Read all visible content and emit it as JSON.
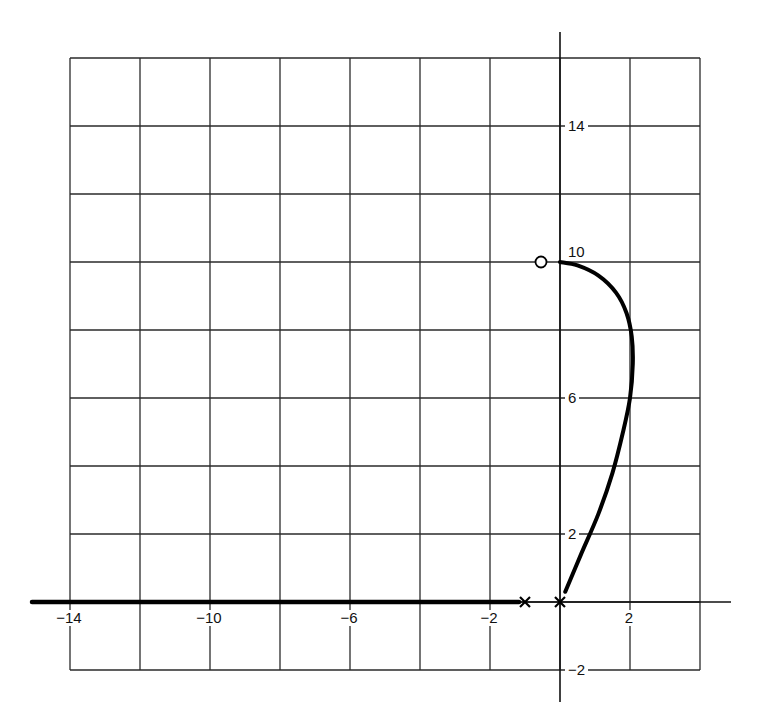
{
  "chart_data": {
    "type": "line",
    "title": "",
    "subtitle": "",
    "xlabel": "",
    "ylabel": "",
    "xlim": [
      -15,
      5
    ],
    "ylim": [
      -3,
      17
    ],
    "grid": true,
    "grid_spacing": 2,
    "grid_extent": {
      "x": [
        -14,
        4
      ],
      "y": [
        -2,
        16
      ]
    },
    "legend": null,
    "x_tick_labels": [
      {
        "value": -14,
        "label": "−14"
      },
      {
        "value": -10,
        "label": "−10"
      },
      {
        "value": -6,
        "label": "−6"
      },
      {
        "value": -2,
        "label": "−2"
      },
      {
        "value": 2,
        "label": "2"
      }
    ],
    "y_tick_labels": [
      {
        "value": 14,
        "label": "14"
      },
      {
        "value": 10,
        "label": "10"
      },
      {
        "value": 6,
        "label": "6"
      },
      {
        "value": 2,
        "label": "2"
      },
      {
        "value": -2,
        "label": "−2"
      }
    ],
    "poles": [
      {
        "x": -1,
        "y": 0,
        "marker": "x"
      },
      {
        "x": 0,
        "y": 0,
        "marker": "x"
      }
    ],
    "zeros": [
      {
        "x": -0.6,
        "y": 10,
        "marker": "o"
      }
    ],
    "series": [
      {
        "name": "real-axis-locus",
        "x": [
          -15,
          -1
        ],
        "y": [
          0,
          0
        ]
      },
      {
        "name": "complex-branch-locus",
        "x": [
          0.15,
          0.6,
          1.1,
          1.5,
          1.8,
          2.0,
          2.08,
          2.05,
          1.9,
          1.6,
          1.1,
          0.5,
          0.0
        ],
        "y": [
          0.3,
          1.4,
          2.6,
          3.8,
          5.0,
          6.0,
          7.0,
          7.8,
          8.5,
          9.1,
          9.6,
          9.9,
          10.0
        ]
      }
    ]
  }
}
